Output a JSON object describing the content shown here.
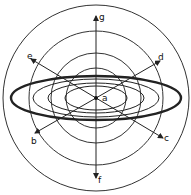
{
  "diagram": {
    "center": {
      "x": 96,
      "y": 98
    },
    "colors": {
      "stroke": "#222222",
      "background": "#ffffff"
    },
    "circles": [
      {
        "r": 93
      },
      {
        "r": 67
      },
      {
        "r": 45
      },
      {
        "r": 30
      }
    ],
    "ellipses": [
      {
        "rx": 85,
        "ry": 22,
        "thick": true
      },
      {
        "rx": 63,
        "ry": 19,
        "thick": false
      },
      {
        "rx": 48,
        "ry": 15,
        "thick": false
      },
      {
        "rx": 31,
        "ry": 12,
        "thick": false
      }
    ],
    "labels": {
      "a": "a",
      "b": "b",
      "c": "c",
      "d": "d",
      "e": "e",
      "f": "f",
      "g": "g"
    }
  }
}
